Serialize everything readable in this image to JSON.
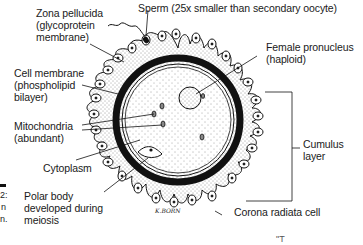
{
  "figure": {
    "labels": {
      "zona_pellucida": {
        "line1": "Zona pellucida",
        "line2": "(glycoprotein",
        "line3": "membrane)"
      },
      "sperm": {
        "line1": "Sperm (25x smaller than secondary oocyte)"
      },
      "female_pronucleus": {
        "line1": "Female pronucleus",
        "line2": "(haploid)"
      },
      "cell_membrane": {
        "line1": "Cell membrane",
        "line2": "(phospholipid",
        "line3": "bilayer)"
      },
      "mitochondria": {
        "line1": "Mitochondria",
        "line2": "(abundant)"
      },
      "cytoplasm": {
        "line1": "Cytoplasm"
      },
      "polar_body": {
        "line1": "Polar body",
        "line2": "developed during",
        "line3": "meiosis"
      },
      "cumulus_layer": {
        "line1": "Cumulus",
        "line2": "layer"
      },
      "corona_radiata": {
        "line1": "Corona radiata cell"
      }
    },
    "signature": "K.BORN",
    "left_edge_fragments": [
      "2:",
      "n",
      "n."
    ],
    "bottom_fragment": "\"T"
  },
  "colors": {
    "ink": "#111111",
    "paper": "#ffffff",
    "stipple": "#333333"
  }
}
